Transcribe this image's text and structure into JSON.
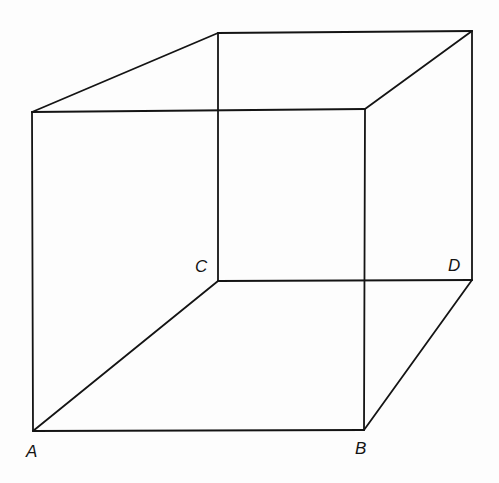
{
  "figure": {
    "type": "necker-cube-line-drawing",
    "stroke_color": "#141414",
    "background_color": "#fdfdfd",
    "vertices": {
      "front_top_left": [
        32,
        112
      ],
      "front_top_right": [
        365,
        109
      ],
      "A": [
        33,
        431
      ],
      "B": [
        364,
        430
      ],
      "back_top_left": [
        218,
        33
      ],
      "back_top_right": [
        472,
        31
      ],
      "C": [
        218,
        281
      ],
      "D": [
        472,
        280
      ]
    },
    "labels": {
      "A": "A",
      "B": "B",
      "C": "C",
      "D": "D"
    }
  }
}
